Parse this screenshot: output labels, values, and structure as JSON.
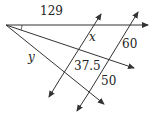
{
  "diagram": {
    "type": "geometry-transversals",
    "labels": {
      "top_segment": "129",
      "x": "x",
      "y": "y",
      "middle_segment": "37.5",
      "right_upper": "60",
      "right_lower": "50"
    },
    "colors": {
      "line": "#333333",
      "text": "#222222",
      "background": "#ffffff"
    }
  }
}
